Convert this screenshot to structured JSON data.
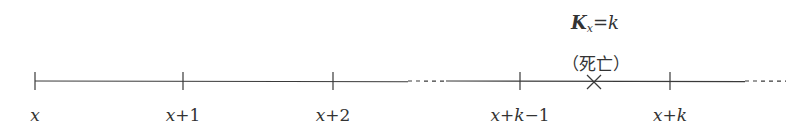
{
  "diagram": {
    "type": "timeline",
    "axis_y": 81,
    "line_color": "#3a3a3a",
    "segments": [
      {
        "style": "solid",
        "x1": 35,
        "x2": 408
      },
      {
        "style": "dotted",
        "x1": 408,
        "x2": 446
      },
      {
        "style": "solid",
        "x1": 446,
        "x2": 745
      },
      {
        "style": "dotted",
        "x1": 745,
        "x2": 786
      }
    ],
    "ticks": [
      {
        "x": 35,
        "label_var": "x",
        "label_rest": ""
      },
      {
        "x": 183,
        "label_var": "x",
        "label_rest": "+1"
      },
      {
        "x": 333,
        "label_var": "x",
        "label_rest": "+2"
      },
      {
        "x": 520,
        "label_var": "x",
        "label_rest": "+k−1"
      },
      {
        "x": 670,
        "label_var": "x",
        "label_rest": "+k"
      }
    ],
    "event": {
      "x": 594,
      "marker": "cross",
      "label": "（死亡）"
    },
    "title": {
      "symbol": "K",
      "subscript": "x",
      "rest": "=k"
    }
  }
}
